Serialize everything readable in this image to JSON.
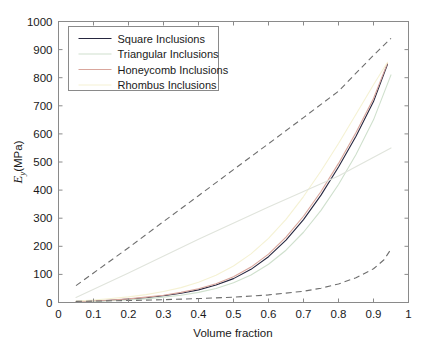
{
  "chart_data": {
    "type": "line",
    "title": "",
    "xlabel": "Volume fraction",
    "ylabel": "E_y(MPa)",
    "ylabel_base": "E",
    "ylabel_sub": "y",
    "ylabel_unit": "(MPa)",
    "xlim": [
      0,
      1
    ],
    "ylim": [
      0,
      1000
    ],
    "xticks": [
      0,
      0.1,
      0.2,
      0.3,
      0.4,
      0.5,
      0.6,
      0.7,
      0.8,
      0.9,
      1
    ],
    "xticklabels": [
      "0",
      "0.1",
      "0.2",
      "0.3",
      "0.4",
      "0.5",
      "0.6",
      "0.7",
      "0.8",
      "0.9",
      "1"
    ],
    "yticks": [
      0,
      100,
      200,
      300,
      400,
      500,
      600,
      700,
      800,
      900,
      1000
    ],
    "yticklabels": [
      "0",
      "100",
      "200",
      "300",
      "400",
      "500",
      "600",
      "700",
      "800",
      "900",
      "1000"
    ],
    "grid": false,
    "legend_position": "upper left",
    "legend_entries": [
      "Square Inclusions",
      "Triangular Inclusions",
      "Honeycomb Inclusions",
      "Rhombus Inclusions"
    ],
    "colors": {
      "square": "#26273f",
      "triangular": "#cfe0cd",
      "honeycomb": "#d9a69c",
      "rhombus": "#f5f2d4",
      "bound_upper": "#6e6e6e",
      "bound_lower": "#6e6e6e",
      "faint_line": "#e0e4dc",
      "frame": "#8a8a8a",
      "text": "#1a1a1a",
      "background": "#ffffff"
    },
    "series": [
      {
        "name": "Square Inclusions",
        "color_key": "square",
        "style": "solid",
        "x": [
          0.05,
          0.1,
          0.15,
          0.2,
          0.25,
          0.3,
          0.35,
          0.4,
          0.45,
          0.5,
          0.55,
          0.6,
          0.65,
          0.7,
          0.75,
          0.8,
          0.85,
          0.9,
          0.94
        ],
        "y": [
          3,
          5,
          8,
          12,
          17,
          24,
          33,
          45,
          62,
          85,
          118,
          163,
          222,
          295,
          382,
          482,
          592,
          715,
          848
        ]
      },
      {
        "name": "Triangular Inclusions",
        "color_key": "triangular",
        "style": "solid",
        "x": [
          0.05,
          0.1,
          0.15,
          0.2,
          0.25,
          0.3,
          0.35,
          0.4,
          0.45,
          0.5,
          0.55,
          0.6,
          0.65,
          0.7,
          0.75,
          0.8,
          0.85,
          0.9,
          0.95
        ],
        "y": [
          2,
          4,
          6,
          9,
          13,
          19,
          26,
          36,
          50,
          70,
          98,
          136,
          186,
          250,
          328,
          420,
          527,
          650,
          810
        ]
      },
      {
        "name": "Honeycomb Inclusions",
        "color_key": "honeycomb",
        "style": "solid",
        "x": [
          0.05,
          0.1,
          0.15,
          0.2,
          0.25,
          0.3,
          0.35,
          0.4,
          0.45,
          0.5,
          0.55,
          0.6,
          0.65,
          0.7,
          0.75,
          0.8,
          0.85,
          0.9,
          0.94
        ],
        "y": [
          3,
          6,
          9,
          13,
          19,
          26,
          36,
          49,
          67,
          92,
          126,
          172,
          233,
          307,
          395,
          495,
          605,
          726,
          852
        ]
      },
      {
        "name": "Rhombus Inclusions",
        "color_key": "rhombus",
        "style": "solid",
        "x": [
          0.05,
          0.1,
          0.15,
          0.2,
          0.25,
          0.3,
          0.35,
          0.4,
          0.45,
          0.5,
          0.55,
          0.6,
          0.65,
          0.7,
          0.75,
          0.8,
          0.85,
          0.9,
          0.94
        ],
        "y": [
          5,
          9,
          14,
          20,
          28,
          39,
          53,
          72,
          97,
          130,
          173,
          228,
          296,
          377,
          468,
          566,
          670,
          775,
          855
        ]
      },
      {
        "name": "Upper bound",
        "color_key": "bound_upper",
        "style": "dashed",
        "x": [
          0.05,
          0.1,
          0.2,
          0.3,
          0.4,
          0.5,
          0.6,
          0.7,
          0.8,
          0.9,
          0.95
        ],
        "y": [
          60,
          105,
          195,
          288,
          380,
          473,
          565,
          658,
          752,
          880,
          940
        ]
      },
      {
        "name": "Lower bound",
        "color_key": "bound_lower",
        "style": "dashed",
        "x": [
          0.05,
          0.1,
          0.2,
          0.3,
          0.4,
          0.5,
          0.6,
          0.7,
          0.75,
          0.8,
          0.85,
          0.9,
          0.93,
          0.95
        ],
        "y": [
          4,
          5,
          7,
          10,
          14,
          19,
          27,
          40,
          51,
          66,
          88,
          120,
          152,
          190
        ]
      },
      {
        "name": "Faint reference line",
        "color_key": "faint_line",
        "style": "solid",
        "x": [
          0.05,
          0.2,
          0.4,
          0.6,
          0.8,
          0.95
        ],
        "y": [
          18,
          105,
          225,
          340,
          450,
          550
        ]
      }
    ]
  }
}
